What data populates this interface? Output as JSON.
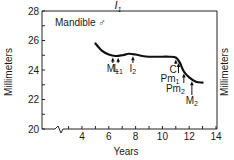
{
  "chart_data": {
    "type": "line",
    "title": "I1",
    "title_main": "I",
    "title_sub": "1",
    "annotation_label": "Mandible ♂",
    "xlabel": "Years",
    "ylabel": "Millimeters",
    "ylabel_right": "Millimeters",
    "xlim": [
      2,
      14
    ],
    "ylim": [
      20,
      28
    ],
    "x_ticks": [
      4,
      6,
      8,
      10,
      12,
      14
    ],
    "y_ticks": [
      20,
      22,
      24,
      26,
      28
    ],
    "x_axis_break": true,
    "grid": false,
    "legend": "none",
    "series": [
      {
        "name": "Mandible ♂ I1",
        "x": [
          5.0,
          5.5,
          6.0,
          6.5,
          7.0,
          7.5,
          8.0,
          8.5,
          9.0,
          9.5,
          10.0,
          10.5,
          11.0,
          11.3,
          11.6,
          12.0,
          12.5,
          13.0
        ],
        "y": [
          25.8,
          25.3,
          25.05,
          24.95,
          25.0,
          25.1,
          25.05,
          24.95,
          24.9,
          24.9,
          24.9,
          24.9,
          24.85,
          24.5,
          23.9,
          23.5,
          23.2,
          23.15
        ]
      }
    ],
    "annotations": [
      {
        "label": "M",
        "sub": "1",
        "x": 6.3
      },
      {
        "label": "L",
        "sub": "1",
        "x": 6.7
      },
      {
        "label": "I",
        "sub": "2",
        "x": 7.8
      },
      {
        "label": "C",
        "sub": "",
        "x": 11.0
      },
      {
        "label": "Pm",
        "sub": "1",
        "x": 11.2
      },
      {
        "label": "Pm",
        "sub": "2",
        "x": 11.6
      },
      {
        "label": "M",
        "sub": "2",
        "x": 12.2
      }
    ]
  }
}
